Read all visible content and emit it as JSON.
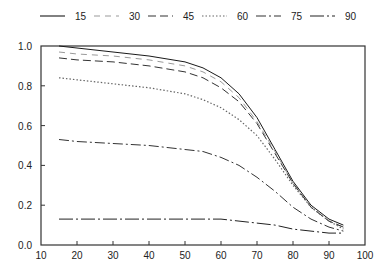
{
  "chart_data": {
    "type": "line",
    "title": "",
    "xlabel": "",
    "ylabel": "",
    "xlim": [
      10,
      100
    ],
    "ylim": [
      0.0,
      1.0
    ],
    "x_ticks": [
      10,
      20,
      30,
      40,
      50,
      60,
      70,
      80,
      90,
      100
    ],
    "y_ticks": [
      0.0,
      0.2,
      0.4,
      0.6,
      0.8,
      1.0
    ],
    "y_tick_labels": [
      "0.0",
      "0.2",
      "0.4",
      "0.6",
      "0.8",
      "1.0"
    ],
    "grid": false,
    "legend_position": "top",
    "x": [
      15,
      20,
      30,
      40,
      50,
      55,
      60,
      65,
      70,
      75,
      80,
      85,
      90,
      94
    ],
    "series": [
      {
        "name": "15",
        "style": "solid",
        "color": "#1a1a1a",
        "values": [
          1.0,
          0.99,
          0.97,
          0.95,
          0.92,
          0.89,
          0.84,
          0.76,
          0.64,
          0.48,
          0.32,
          0.2,
          0.13,
          0.1
        ]
      },
      {
        "name": "30",
        "style": "dashed-light",
        "color": "#9a9a9a",
        "values": [
          0.97,
          0.96,
          0.95,
          0.93,
          0.9,
          0.87,
          0.82,
          0.74,
          0.62,
          0.47,
          0.31,
          0.19,
          0.12,
          0.09
        ]
      },
      {
        "name": "45",
        "style": "dashed",
        "color": "#333333",
        "values": [
          0.94,
          0.93,
          0.92,
          0.9,
          0.87,
          0.84,
          0.79,
          0.72,
          0.61,
          0.46,
          0.31,
          0.19,
          0.12,
          0.09
        ]
      },
      {
        "name": "60",
        "style": "dotted",
        "color": "#666666",
        "values": [
          0.84,
          0.83,
          0.81,
          0.79,
          0.76,
          0.73,
          0.69,
          0.63,
          0.55,
          0.43,
          0.3,
          0.19,
          0.12,
          0.08
        ]
      },
      {
        "name": "75",
        "style": "dash-dot",
        "color": "#333333",
        "values": [
          0.53,
          0.52,
          0.51,
          0.5,
          0.48,
          0.47,
          0.44,
          0.4,
          0.34,
          0.27,
          0.19,
          0.13,
          0.09,
          0.07
        ]
      },
      {
        "name": "90",
        "style": "dash-dot-long",
        "color": "#222222",
        "values": [
          0.13,
          0.13,
          0.13,
          0.13,
          0.13,
          0.13,
          0.13,
          0.12,
          0.11,
          0.1,
          0.08,
          0.07,
          0.06,
          0.06
        ]
      }
    ]
  },
  "legend": {
    "items": [
      {
        "label": "15"
      },
      {
        "label": "30"
      },
      {
        "label": "45"
      },
      {
        "label": "60"
      },
      {
        "label": "75"
      },
      {
        "label": "90"
      }
    ]
  }
}
